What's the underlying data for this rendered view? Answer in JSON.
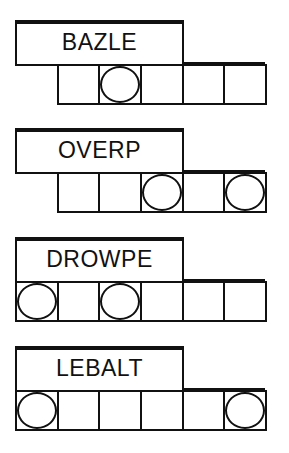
{
  "puzzles": [
    {
      "scrambled": "BAZLE",
      "cells": 5,
      "start_offset": 1,
      "circled": [
        2
      ]
    },
    {
      "scrambled": "OVERP",
      "cells": 5,
      "start_offset": 1,
      "circled": [
        3,
        5
      ]
    },
    {
      "scrambled": "DROWPE",
      "cells": 6,
      "start_offset": 0,
      "circled": [
        1,
        3
      ]
    },
    {
      "scrambled": "LEBALT",
      "cells": 6,
      "start_offset": 0,
      "circled": [
        1,
        6
      ]
    }
  ],
  "colors": {
    "ink": "#111111",
    "paper": "#ffffff"
  }
}
